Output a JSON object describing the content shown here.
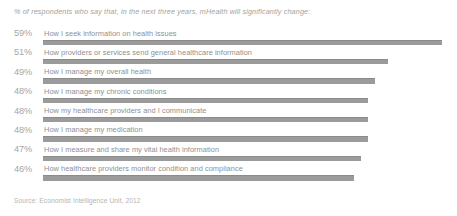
{
  "headline": "% of respondents who say that, in the next three years, mHealth will significantly change:",
  "source": "Source: Economist Intelligence Unit, 2012",
  "colors": {
    "bar": "#8e8e8e",
    "bar_edge": "#7c7c7c",
    "text": "#8f8f8f",
    "pct_text": "#a6a6a6",
    "background": "#ffffff"
  },
  "chart_data": {
    "type": "bar",
    "orientation": "horizontal",
    "title": "% of respondents who say that, in the next three years, mHealth will significantly change:",
    "xlabel": "",
    "ylabel": "",
    "xlim": [
      0,
      60
    ],
    "grid": false,
    "legend": false,
    "units": "%",
    "categories": [
      "How I seek information on health issues",
      "How providers or services send general healthcare information",
      "How I manage my overall health",
      "How I manage my chronic conditions",
      "How my healthcare providers and I communicate",
      "How I manage my medication",
      "How I measure and share my vital health information",
      "How healthcare providers monitor condition and compliance"
    ],
    "values": [
      59,
      51,
      49,
      48,
      48,
      48,
      47,
      46
    ],
    "value_labels": [
      "59%",
      "51%",
      "49%",
      "48%",
      "48%",
      "48%",
      "47%",
      "46%"
    ],
    "source": "Source: Economist Intelligence Unit, 2012"
  },
  "rows": [
    {
      "pct": "59%",
      "label": "How I seek information on health issues",
      "value": 59
    },
    {
      "pct": "51%",
      "label": "How providers or services send general healthcare information",
      "value": 51
    },
    {
      "pct": "49%",
      "label": "How I manage my overall health",
      "value": 49
    },
    {
      "pct": "48%",
      "label": "How I manage my chronic conditions",
      "value": 48
    },
    {
      "pct": "48%",
      "label": "How my healthcare providers and I communicate",
      "value": 48
    },
    {
      "pct": "48%",
      "label": "How I manage my medication",
      "value": 48
    },
    {
      "pct": "47%",
      "label": "How I measure and share my vital health information",
      "value": 47
    },
    {
      "pct": "46%",
      "label": "How healthcare providers monitor condition and compliance",
      "value": 46
    }
  ]
}
